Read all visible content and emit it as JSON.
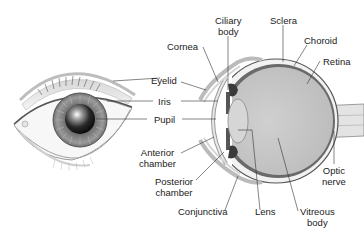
{
  "diagram": {
    "views": [
      "front view",
      "cross section"
    ],
    "labels": {
      "ciliary_body_1": "Ciliary",
      "ciliary_body_2": "body",
      "sclera": "Sclera",
      "choroid": "Choroid",
      "retina": "Retina",
      "cornea": "Cornea",
      "eyelid": "Eyelid",
      "iris": "Iris",
      "pupil": "Pupil",
      "anterior_chamber_1": "Anterior",
      "anterior_chamber_2": "chamber",
      "posterior_chamber_1": "Posterior",
      "posterior_chamber_2": "chamber",
      "conjunctiva": "Conjunctiva",
      "lens": "Lens",
      "vitreous_body_1": "Vitreous",
      "vitreous_body_2": "body",
      "optic_nerve_1": "Optic",
      "optic_nerve_2": "nerve"
    },
    "colors": {
      "vitreous": "#c8c8c8",
      "sclera": "#f2f2f2",
      "choroid": "#6a6a6a",
      "iris": "#8a8a8a",
      "pupil": "#111111",
      "leader_line": "#333333",
      "text": "#222222"
    }
  }
}
